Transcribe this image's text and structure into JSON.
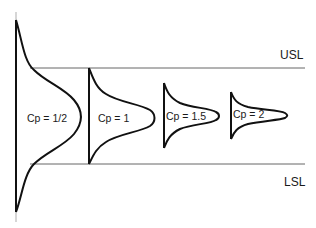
{
  "diagram": {
    "limits": {
      "upper": "USL",
      "lower": "LSL"
    },
    "curves": [
      {
        "label": "Cp = 1/2",
        "cp": 0.5
      },
      {
        "label": "Cp = 1",
        "cp": 1
      },
      {
        "label": "Cp = 1.5",
        "cp": 1.5
      },
      {
        "label": "Cp = 2",
        "cp": 2
      }
    ],
    "colors": {
      "curve": "#111111",
      "limit_line": "#555555"
    }
  }
}
